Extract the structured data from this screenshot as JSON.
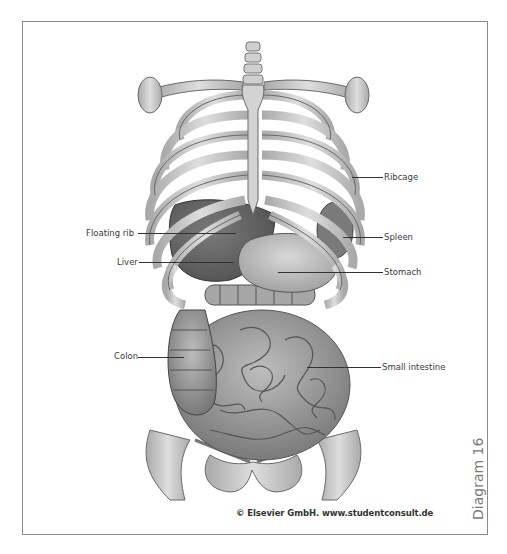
{
  "figure": {
    "diagram_tag": "Diagram 16",
    "copyright": "© Elsevier GmbH. www.studentconsult.de"
  },
  "labels": {
    "left": [
      {
        "text": "Floating rib"
      },
      {
        "text": "Liver"
      },
      {
        "text": "Colon"
      }
    ],
    "right": [
      {
        "text": "Ribcage"
      },
      {
        "text": "Spleen"
      },
      {
        "text": "Stomach"
      },
      {
        "text": "Small intestine"
      }
    ]
  },
  "colors": {
    "frame": "#8a8a8a",
    "leader_line": "#333333",
    "bone": "#c9c9c9",
    "organ": "#8f8f8f",
    "text": "#3a3a3a"
  }
}
